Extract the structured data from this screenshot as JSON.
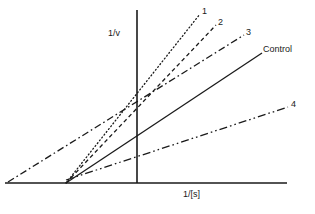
{
  "figure": {
    "type": "lineweaver-burk-plot",
    "background_color": "#ffffff",
    "line_color": "#1a1a1a",
    "axis_color": "#1a1a1a"
  },
  "axes": {
    "y_label": "1/v",
    "x_label": "1/[s]",
    "x_axis": {
      "x1": 5,
      "y1": 183,
      "x2": 287,
      "y2": 183
    },
    "y_axis": {
      "x1": 137,
      "y1": 10,
      "x2": 137,
      "y2": 183
    },
    "origin": {
      "x": 137,
      "y": 183
    }
  },
  "chart_data": {
    "type": "line",
    "title": "",
    "xlabel": "1/[s]",
    "ylabel": "1/v",
    "grid": false,
    "legend": "inline-end-labels",
    "xlim": [
      5,
      287
    ],
    "ylim": [
      183,
      10
    ],
    "note": "Enzyme inhibition double-reciprocal plot; lines 1 and 2 share the control x-intercept (competitive), line 3 crosses left of the axis, line 4 has a shallower slope.",
    "series": [
      {
        "name": "1",
        "label": "1",
        "style": "dotted",
        "dasharray": "1,2.6",
        "width": 1.3,
        "points": [
          [
            66,
            183
          ],
          [
            200,
            14
          ]
        ],
        "label_pos": {
          "x": 202,
          "y": 7
        }
      },
      {
        "name": "2",
        "label": "2",
        "style": "dashed",
        "dasharray": "4,3",
        "width": 1.3,
        "points": [
          [
            66,
            183
          ],
          [
            216,
            25
          ]
        ],
        "label_pos": {
          "x": 218,
          "y": 18
        }
      },
      {
        "name": "3",
        "label": "3",
        "style": "dash-dot",
        "dasharray": "7,3,1.6,3",
        "width": 1.3,
        "points": [
          [
            8,
            182
          ],
          [
            244,
            35
          ]
        ],
        "label_pos": {
          "x": 246,
          "y": 28
        }
      },
      {
        "name": "Control",
        "label": "Control",
        "style": "solid",
        "dasharray": "none",
        "width": 1.3,
        "points": [
          [
            66,
            183
          ],
          [
            262,
            53
          ]
        ],
        "label_pos": {
          "x": 263,
          "y": 45
        }
      },
      {
        "name": "4",
        "label": "4",
        "style": "dash-dot-dot",
        "dasharray": "8,3,1.6,3,1.6,3",
        "width": 1.3,
        "points": [
          [
            66,
            180
          ],
          [
            288,
            107
          ]
        ],
        "label_pos": {
          "x": 291,
          "y": 100
        }
      }
    ]
  }
}
